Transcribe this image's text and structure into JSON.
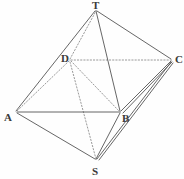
{
  "figure": {
    "kind": "geometry-diagram",
    "width": 184,
    "height": 179,
    "background_color": "#fefefe",
    "solid_line_color": "#4a4a4a",
    "dotted_line_color": "#8a8a8a",
    "label_color": "#3a3a3a",
    "vertices": [
      {
        "id": "T",
        "label": "T",
        "x": 96,
        "y": 10,
        "label_x": 92,
        "label_y": 0
      },
      {
        "id": "D",
        "label": "D",
        "x": 70,
        "y": 60,
        "label_x": 61,
        "label_y": 53
      },
      {
        "id": "C",
        "label": "C",
        "x": 172,
        "y": 60,
        "label_x": 175,
        "label_y": 54
      },
      {
        "id": "A",
        "label": "A",
        "x": 16,
        "y": 112,
        "label_x": 4,
        "label_y": 112
      },
      {
        "id": "B",
        "label": "B",
        "x": 120,
        "y": 112,
        "label_x": 122,
        "label_y": 113
      },
      {
        "id": "S",
        "label": "S",
        "x": 96,
        "y": 160,
        "label_x": 92,
        "label_y": 166
      }
    ],
    "solid_edges": [
      {
        "from": "T",
        "to": "A"
      },
      {
        "from": "T",
        "to": "B"
      },
      {
        "from": "T",
        "to": "C"
      },
      {
        "from": "A",
        "to": "B"
      },
      {
        "from": "A",
        "to": "S"
      },
      {
        "from": "B",
        "to": "S"
      },
      {
        "from": "B",
        "to": "C"
      },
      {
        "from": "C",
        "to": "S"
      },
      {
        "from": "C",
        "to": "B2"
      },
      {
        "from": "C",
        "to": "S2"
      }
    ],
    "dotted_edges": [
      {
        "from": "D",
        "to": "C"
      },
      {
        "from": "D",
        "to": "T"
      },
      {
        "from": "D",
        "to": "A"
      },
      {
        "from": "D",
        "to": "B"
      },
      {
        "from": "D",
        "to": "S"
      }
    ]
  }
}
